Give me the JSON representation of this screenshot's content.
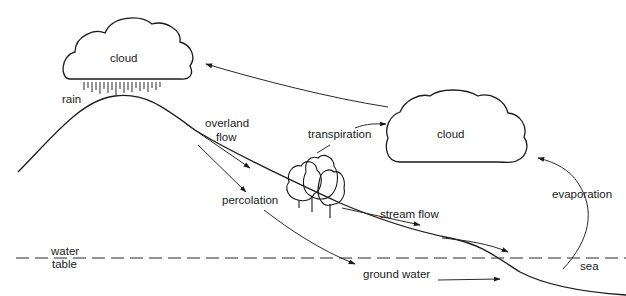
{
  "diagram": {
    "labels": {
      "cloud_left": "cloud",
      "cloud_right": "cloud",
      "rain": "rain",
      "overland_flow_1": "overland",
      "overland_flow_2": "flow",
      "transpiration": "transpiration",
      "percolation": "percolation",
      "stream_flow": "stream flow",
      "evaporation": "evaporation",
      "water_table_1": "water",
      "water_table_2": "table",
      "ground_water": "ground water",
      "sea": "sea"
    },
    "colors": {
      "line": "#1a1a1a",
      "background": "#ffffff"
    }
  }
}
